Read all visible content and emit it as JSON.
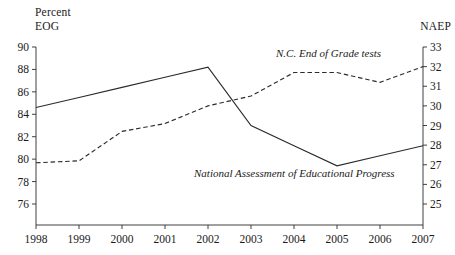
{
  "chart_data": {
    "type": "line",
    "title": "",
    "subtitle": "",
    "xlabel": "",
    "ylabel": "Percent EOG",
    "y2label": "NAEP",
    "grid": false,
    "legend_position": "inline-annotations",
    "x": [
      1998,
      1999,
      2000,
      2001,
      2002,
      2003,
      2004,
      2005,
      2006,
      2007
    ],
    "xtick_labels": [
      "1998",
      "1999",
      "2000",
      "2001",
      "2002",
      "2003",
      "2004",
      "2005",
      "2006",
      "2007"
    ],
    "xlim": [
      1998,
      2007
    ],
    "left_axis": {
      "label_line1": "Percent",
      "label_line2": "EOG",
      "ylim": [
        74,
        90
      ],
      "ticks": [
        90,
        88,
        86,
        84,
        82,
        80,
        78,
        76
      ],
      "tick_labels": [
        "90",
        "88",
        "86",
        "84",
        "82",
        "80",
        "78",
        "76"
      ]
    },
    "right_axis": {
      "label": "NAEP",
      "ylim": [
        24,
        33
      ],
      "ticks": [
        33,
        32,
        31,
        30,
        29,
        28,
        27,
        26,
        25
      ],
      "tick_labels": [
        "33",
        "32",
        "31",
        "30",
        "29",
        "28",
        "27",
        "26",
        "25"
      ]
    },
    "series": [
      {
        "name": "N.C. End of Grade tests",
        "axis": "left",
        "style": "solid",
        "color": "#2b2b2b",
        "annotation": "N.C. End of Grade tests",
        "values": [
          84.6,
          85.5,
          86.4,
          87.3,
          88.2,
          83.0,
          81.2,
          79.4,
          80.3,
          81.2
        ]
      },
      {
        "name": "National Assessment of Educational Progress",
        "axis": "right",
        "style": "dashed",
        "color": "#2b2b2b",
        "annotation": "National Assessment of Educational Progress",
        "values": [
          27.1,
          27.2,
          28.7,
          29.1,
          30.0,
          30.5,
          31.7,
          31.7,
          31.2,
          32.0
        ]
      }
    ]
  }
}
